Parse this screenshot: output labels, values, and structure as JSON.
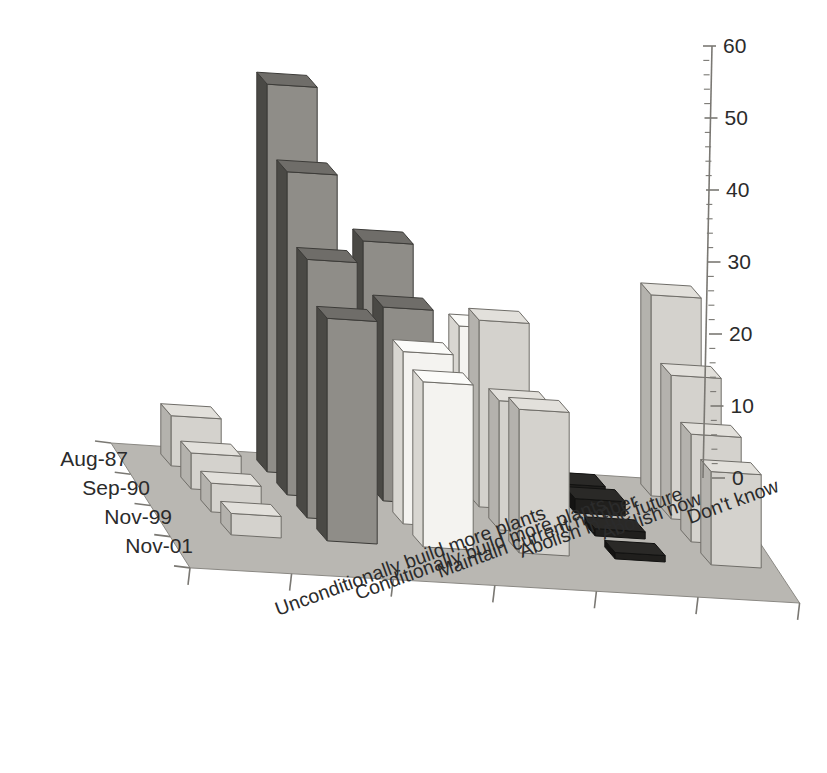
{
  "chart_data": {
    "type": "bar",
    "render": "3d-grouped-bar",
    "title": "",
    "subtitle": "",
    "xlabel": "",
    "ylabel": "",
    "zlabel": "",
    "ylim": [
      0,
      60
    ],
    "ytick_step": 10,
    "yticks": [
      0,
      10,
      20,
      30,
      40,
      50,
      60
    ],
    "ytick_labels": [
      "0",
      "10",
      "20",
      "30",
      "40",
      "50",
      "60"
    ],
    "grid": false,
    "legend": "none",
    "categories": [
      "Unconditionally build more plants",
      "Conditionally build more plants",
      "Maintain current number",
      "Abolish in the future",
      "Abolish now",
      "Don't know"
    ],
    "series": [
      {
        "name": "Aug-87",
        "color": "#d6d4cf",
        "values": [
          7,
          54,
          33,
          22,
          0,
          28
        ]
      },
      {
        "name": "Sep-90",
        "color": "#cfcdc8",
        "values": [
          5,
          45,
          27,
          26,
          2,
          20
        ]
      },
      {
        "name": "Nov-99",
        "color": "#bfbdb8",
        "values": [
          4,
          36,
          24,
          18,
          1,
          15
        ]
      },
      {
        "name": "Nov-01",
        "color": "#b3b1ac",
        "values": [
          3,
          31,
          23,
          20,
          0,
          13
        ]
      }
    ],
    "bar_shades": {
      "unconditionally_build_more_plants": [
        "light",
        "light",
        "light",
        "light"
      ],
      "conditionally_build_more_plants": [
        "dark",
        "dark",
        "dark",
        "dark"
      ],
      "maintain_current_number": [
        "dark",
        "dark",
        "white",
        "white"
      ],
      "abolish_in_the_future": [
        "white",
        "light",
        "light",
        "light"
      ],
      "abolish_now": [
        "black",
        "black",
        "black",
        "black"
      ],
      "dont_know": [
        "light",
        "light",
        "light",
        "light"
      ]
    }
  },
  "axis": {
    "y_axis_name": "value-axis",
    "series_axis_name": "date-axis",
    "category_axis_name": "response-axis"
  },
  "colors": {
    "floor": "#b9b7b2",
    "floor_edge": "#8a8883",
    "axis_line": "#7a7873",
    "text": "#2b2b2b",
    "bar_light_top": "#e2e0db",
    "bar_light_front": "#d4d2cd",
    "bar_light_side": "#b4b2ad",
    "bar_white_top": "#fbfbf9",
    "bar_white_front": "#f4f3f0",
    "bar_white_side": "#d8d6d1",
    "bar_dark_top": "#6f6d69",
    "bar_dark_front": "#8f8d88",
    "bar_dark_side": "#4a4945",
    "bar_black_top": "#2a2927",
    "bar_black_front": "#201f1d",
    "bar_black_side": "#141312"
  }
}
